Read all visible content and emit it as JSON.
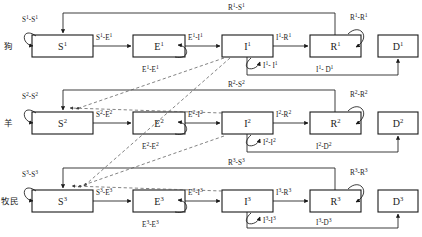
{
  "diagram": {
    "type": "multi-species-SEIRD-transmission-flow",
    "rows": [
      {
        "id": "row-dog",
        "species_label": "狗",
        "superscript": "1",
        "nodes": [
          {
            "id": "S1",
            "base": "S",
            "sup": "1"
          },
          {
            "id": "E1",
            "base": "E",
            "sup": "1"
          },
          {
            "id": "I1",
            "base": "I",
            "sup": "1"
          },
          {
            "id": "R1",
            "base": "R",
            "sup": "1"
          },
          {
            "id": "D1",
            "base": "D",
            "sup": "1"
          }
        ],
        "edge_labels": {
          "s_self": "S1-S1",
          "s_to_e": "S1-E1",
          "e_self": "E1-E1",
          "e_to_i": "E1-I1",
          "i_self": "I1- I1",
          "i_to_r": "I1-R1",
          "r_self": "R1-R1",
          "r_to_s": "R1-S1",
          "i_to_d": "I1- D1"
        }
      },
      {
        "id": "row-sheep",
        "species_label": "羊",
        "superscript": "2",
        "nodes": [
          {
            "id": "S2",
            "base": "S",
            "sup": "2"
          },
          {
            "id": "E2",
            "base": "E",
            "sup": "2"
          },
          {
            "id": "I2",
            "base": "I",
            "sup": "2"
          },
          {
            "id": "R2",
            "base": "R",
            "sup": "2"
          },
          {
            "id": "D2",
            "base": "D",
            "sup": "2"
          }
        ],
        "edge_labels": {
          "s_self": "S2-S2",
          "s_to_e": "S2-E2",
          "e_self": "E2-E2",
          "e_to_i": "E2-I2",
          "i_self": "I2-I2",
          "i_to_r": "I2-R2",
          "r_self": "R2-R2",
          "r_to_s": "R2-S2",
          "i_to_d": "I2-D2"
        }
      },
      {
        "id": "row-herdsman",
        "species_label": "牧民",
        "superscript": "3",
        "nodes": [
          {
            "id": "S3",
            "base": "S",
            "sup": "3"
          },
          {
            "id": "E3",
            "base": "E",
            "sup": "3"
          },
          {
            "id": "I3",
            "base": "I",
            "sup": "3"
          },
          {
            "id": "R3",
            "base": "R",
            "sup": "3"
          },
          {
            "id": "D3",
            "base": "D",
            "sup": "3"
          }
        ],
        "edge_labels": {
          "s_self": "S3-S3",
          "s_to_e": "S3-E3",
          "e_self": "E3-E3",
          "e_to_i": "E3-I3",
          "i_self": "I3-I3",
          "i_to_r": "I3-R3",
          "r_self": "R3-R3",
          "r_to_s": "R3-S3",
          "i_to_d": "I3-D3"
        }
      }
    ],
    "cross_species_links": [
      {
        "from": "I1",
        "to": "S2",
        "style": "dashed"
      },
      {
        "from": "I1",
        "to": "S3",
        "style": "dashed"
      },
      {
        "from": "I2",
        "to": "S2",
        "style": "dashed"
      },
      {
        "from": "I2",
        "to": "S3",
        "style": "dashed"
      },
      {
        "from": "I3",
        "to": "S3",
        "style": "dashed"
      }
    ],
    "colors": {
      "stroke": "#1a1a1a",
      "dashed_stroke": "#5a5a5a",
      "node_fill": "#ffffff",
      "background": "#ffffff"
    }
  }
}
